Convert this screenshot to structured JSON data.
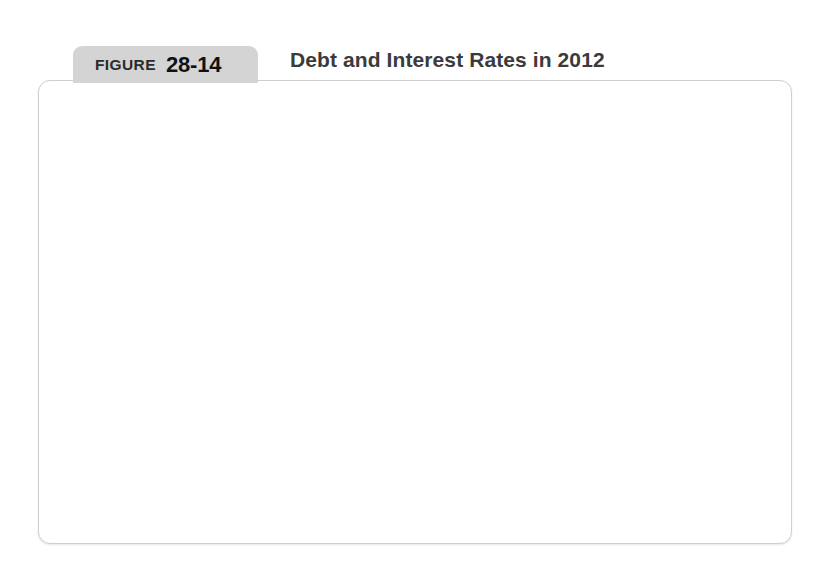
{
  "figure": {
    "label": "FIGURE",
    "number": "28-14",
    "title": "Debt and Interest Rates in 2012"
  },
  "source": {
    "prefix": "Sources",
    "text": ": Eurostat; International Monetary Fund."
  },
  "chart_data": {
    "type": "scatter",
    "title": "Debt and Interest Rates in 2012",
    "xlabel": "Debt ratio (percent of GDP)",
    "ylabel": "Interest rate\n(percent)",
    "xlim": [
      50,
      200
    ],
    "ylim": [
      0,
      27.8
    ],
    "xticks": [
      50,
      100,
      150,
      200
    ],
    "xticklabels": [
      "50",
      "100",
      "150",
      "200%"
    ],
    "yticks": [
      5,
      10,
      15,
      20,
      25
    ],
    "yticklabels": [
      "5",
      "10",
      "15",
      "20",
      "25%"
    ],
    "grid": false,
    "legend_position": "top-left",
    "colors": {
      "euro_area": "#cfcfcf",
      "own_currencies": "#3a3a3a"
    },
    "series": [
      {
        "name": "Euro Area",
        "color": "#cfcfcf",
        "points": [
          {
            "x": 52,
            "y": 5.9
          },
          {
            "x": 58,
            "y": 1.6
          },
          {
            "x": 80,
            "y": 2.9
          },
          {
            "x": 83,
            "y": 2.4
          },
          {
            "x": 92,
            "y": 6.3
          },
          {
            "x": 106,
            "y": 5.6
          },
          {
            "x": 115,
            "y": 10.6
          },
          {
            "x": 153,
            "y": 22.5
          }
        ]
      },
      {
        "name": "Countries with their\nown currencies",
        "color": "#3a3a3a",
        "points": [
          {
            "x": 80,
            "y": 1.9
          },
          {
            "x": 129,
            "y": 1.3
          }
        ]
      }
    ]
  }
}
